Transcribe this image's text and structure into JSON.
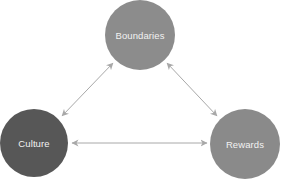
{
  "diagram": {
    "type": "triangle-relationship",
    "nodes": [
      {
        "id": "boundaries",
        "label": "Boundaries",
        "cx": 140,
        "cy": 35,
        "r": 35,
        "color": "#8c8c8c"
      },
      {
        "id": "culture",
        "label": "Culture",
        "cx": 34,
        "cy": 143,
        "r": 34,
        "color": "#575757"
      },
      {
        "id": "rewards",
        "label": "Rewards",
        "cx": 245,
        "cy": 144,
        "r": 35,
        "color": "#8a8a8a"
      }
    ],
    "edges": [
      {
        "from": "boundaries",
        "to": "culture",
        "direction": "bidirectional"
      },
      {
        "from": "boundaries",
        "to": "rewards",
        "direction": "bidirectional"
      },
      {
        "from": "culture",
        "to": "rewards",
        "direction": "bidirectional"
      }
    ],
    "edge_color": "#a8a8a8",
    "background": "#ffffff"
  }
}
